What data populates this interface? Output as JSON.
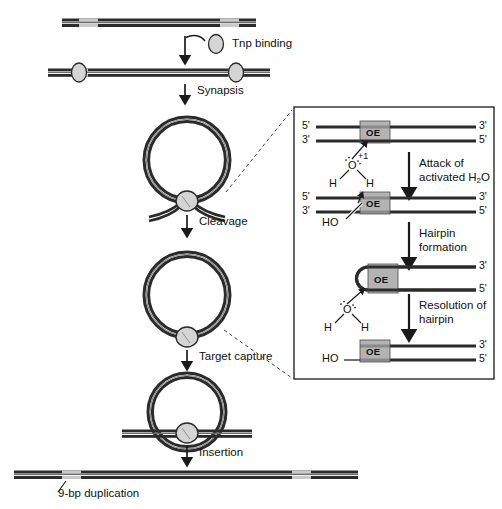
{
  "figure": {
    "bottom_annotation": "9-bp duplication"
  },
  "colors": {
    "dna_dark": "#2b2b2b",
    "dna_light": "#c9c9c9",
    "oe_box_fill": "#b3b3b3",
    "tnp_fill": "#d4d4d4",
    "outline": "#1a1a1a",
    "background": "#ffffff"
  },
  "main_pathway": {
    "steps": [
      {
        "id": "tnp-binding",
        "label": "Tnp binding"
      },
      {
        "id": "synapsis",
        "label": "Synapsis"
      },
      {
        "id": "cleavage",
        "label": "Cleavage"
      },
      {
        "id": "target-capture",
        "label": "Target capture"
      },
      {
        "id": "insertion",
        "label": "Insertion"
      }
    ],
    "legend_molecule": "Tnp"
  },
  "inset": {
    "panels": [
      {
        "id": "panel-1-duplex",
        "left_labels": [
          "5'",
          "3'"
        ],
        "right_labels": [
          "3'",
          "5'"
        ],
        "element_label": "OE",
        "charge_label": "+1",
        "water": {
          "oxygen": "O",
          "hydrogen_left": "H",
          "hydrogen_right": "H"
        }
      },
      {
        "id": "panel-2-nicked",
        "left_labels": [
          "5'",
          "3'"
        ],
        "right_labels": [
          "3'",
          "5'"
        ],
        "element_label": "OE",
        "hydroxyl_label": "HO"
      },
      {
        "id": "panel-3-hairpin",
        "right_labels": [
          "3'",
          "5'"
        ],
        "element_label": "OE",
        "water": {
          "oxygen": "O",
          "hydrogen_left": "H",
          "hydrogen_right": "H"
        }
      },
      {
        "id": "panel-4-resolved",
        "right_labels": [
          "3'",
          "5'"
        ],
        "element_label": "OE",
        "hydroxyl_label": "HO"
      }
    ],
    "arrows": [
      {
        "id": "arrow-attack",
        "line1": "Attack of",
        "line2": "activated H",
        "sub": "2",
        "line2_tail": "O"
      },
      {
        "id": "arrow-hairpin",
        "line1": "Hairpin",
        "line2": "formation"
      },
      {
        "id": "arrow-resolution",
        "line1": "Resolution of",
        "line2": "hairpin"
      }
    ]
  }
}
